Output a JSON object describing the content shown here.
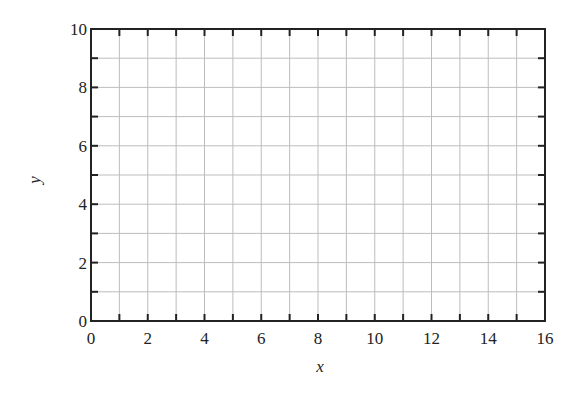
{
  "chart_data": {
    "type": "line",
    "title": "",
    "xlabel": "x",
    "ylabel": "y",
    "xlim": [
      0,
      16
    ],
    "ylim": [
      0,
      10
    ],
    "x_ticks": [
      0,
      2,
      4,
      6,
      8,
      10,
      12,
      14,
      16
    ],
    "y_ticks": [
      0,
      2,
      4,
      6,
      8,
      10
    ],
    "x_minor_step": 1,
    "y_minor_step": 1,
    "grid": true,
    "legend": null,
    "series": []
  },
  "colors": {
    "axis": "#222222",
    "grid": "#bdbdbd",
    "background": "#ffffff"
  }
}
